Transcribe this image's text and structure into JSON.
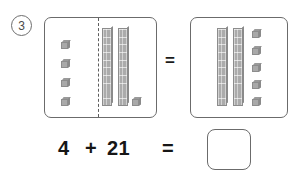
{
  "problem": {
    "number_label": "3"
  },
  "left_panel": {
    "name": "addends-panel",
    "left_group": {
      "label": "four-ones-cubes",
      "ones_count": 4,
      "tens_count": 0,
      "value": 4
    },
    "right_group": {
      "label": "twenty-one-blocks",
      "ones_count": 1,
      "tens_count": 2,
      "value": 21
    },
    "divider": "dashed-vertical-divider"
  },
  "between_equals": {
    "symbol": "="
  },
  "right_panel": {
    "name": "sum-panel",
    "tens_count": 2,
    "ones_count": 5,
    "value": 25
  },
  "equation": {
    "addend1": "4",
    "plus": "+",
    "addend2": "21",
    "equals": "=",
    "answer": ""
  },
  "colors": {
    "block_fill": "#a9a9a9",
    "block_stroke": "#8c8c8c",
    "panel_stroke": "#6b6b6b",
    "text": "#161616"
  }
}
